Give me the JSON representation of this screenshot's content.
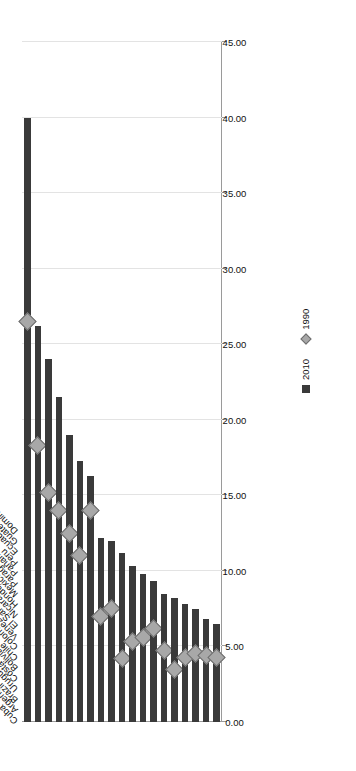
{
  "chart_data": {
    "type": "bar",
    "title": "",
    "subtitle": "",
    "xlabel": "",
    "ylabel": "",
    "orientation": "horizontal-rotated",
    "grid": true,
    "legend_position": "right",
    "axis": {
      "min": 0.0,
      "max": 45.0,
      "step": 5.0,
      "tick_labels": [
        "0.00",
        "5.00",
        "10.00",
        "15.00",
        "20.00",
        "25.00",
        "30.00",
        "35.00",
        "40.00",
        "45.00"
      ],
      "tick_values": [
        0,
        5,
        10,
        15,
        20,
        25,
        30,
        35,
        40,
        45
      ]
    },
    "categories": [
      "Cuba",
      "Argentina",
      "Brazil",
      "Uruguay",
      "Costa Rica",
      "Bolivia (Plurinational State of)",
      "Chile",
      "Colombia",
      "Venezuela (Bolivarian Rep. of)",
      "El Salvador",
      "Nicaragua",
      "Honduras",
      "Mexico",
      "Paraguay",
      "Panama",
      "Peru",
      "Ecuador",
      "Guatemala",
      "Dominican Republic"
    ],
    "series": [
      {
        "name": "2010",
        "marker": "square",
        "color": "#3a3a3a",
        "values": [
          40.0,
          26.2,
          24.0,
          21.5,
          19.0,
          17.3,
          16.3,
          12.2,
          12.0,
          11.2,
          10.3,
          9.8,
          9.3,
          8.5,
          8.2,
          7.8,
          7.5,
          6.8,
          6.5
        ]
      },
      {
        "name": "1990",
        "marker": "diamond",
        "color": "#a8a8a8",
        "values": [
          26.5,
          18.3,
          15.2,
          14.0,
          12.5,
          11.0,
          14.0,
          7.0,
          7.5,
          4.2,
          5.3,
          5.6,
          6.2,
          4.7,
          3.5,
          4.3,
          4.5,
          4.4,
          4.3
        ]
      }
    ],
    "legend": [
      {
        "label": "2010",
        "marker": "square",
        "color": "#3a3a3a"
      },
      {
        "label": "1990",
        "marker": "diamond",
        "color": "#a8a8a8"
      }
    ]
  }
}
